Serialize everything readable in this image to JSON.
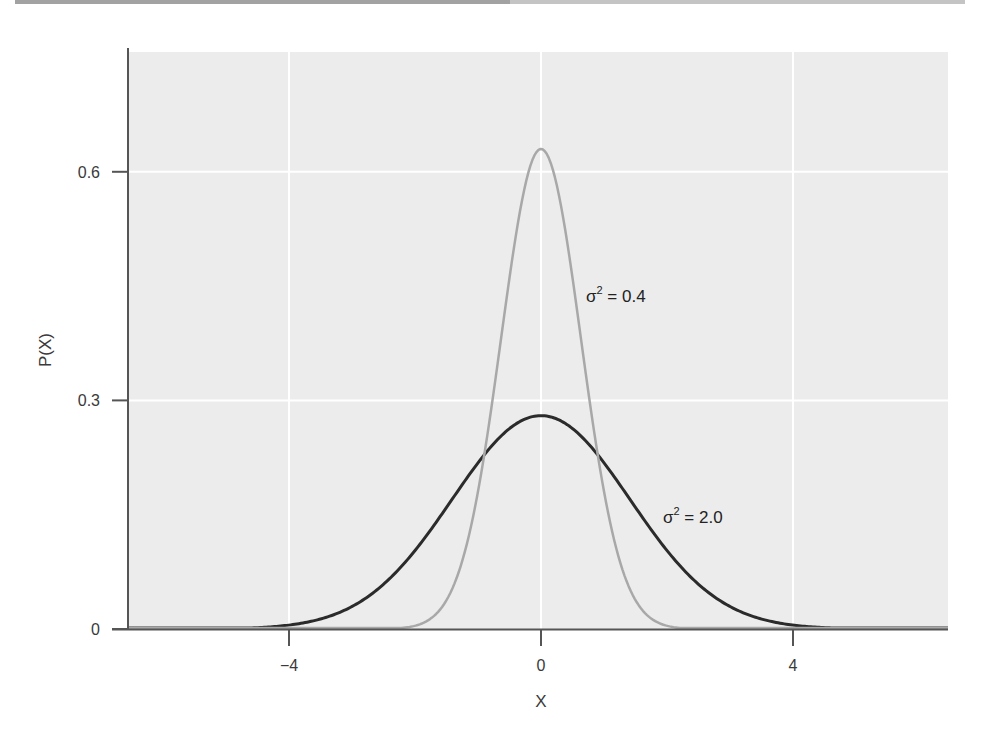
{
  "chart_data": {
    "type": "line",
    "title": "",
    "xlabel": "X",
    "ylabel": "P(X)",
    "xlim": [
      -6.3,
      6.4
    ],
    "ylim": [
      0,
      0.75
    ],
    "x_ticks": [
      -4,
      0,
      4
    ],
    "x_tick_labels": [
      "−4",
      "0",
      "4"
    ],
    "y_ticks": [
      0,
      0.3,
      0.6
    ],
    "y_tick_labels": [
      "0",
      "0.3",
      "0.6"
    ],
    "grid": true,
    "legend": "none (inline annotations)",
    "series": [
      {
        "name": "σ² = 0.4",
        "distribution": "normal",
        "mean": 0,
        "variance": 0.4,
        "peak": 0.63,
        "color": "#a8a8a8",
        "x": [
          -3,
          -2,
          -1.5,
          -1,
          -0.5,
          0,
          0.5,
          1,
          1.5,
          2,
          3
        ],
        "values": [
          0.0,
          0.004,
          0.037,
          0.181,
          0.461,
          0.631,
          0.461,
          0.181,
          0.037,
          0.004,
          0.0
        ]
      },
      {
        "name": "σ² = 2.0",
        "distribution": "normal",
        "mean": 0,
        "variance": 2.0,
        "peak": 0.28,
        "color": "#2b2b2b",
        "x": [
          -6,
          -5,
          -4,
          -3,
          -2,
          -1,
          0,
          1,
          2,
          3,
          4,
          5,
          6
        ],
        "values": [
          0.0003,
          0.0055,
          0.0511,
          0.0297,
          0.1038,
          0.2197,
          0.2821,
          0.2197,
          0.1038,
          0.0297,
          0.0051,
          0.0005,
          0.0
        ]
      }
    ],
    "annotations": [
      {
        "text": "σ² = 0.4",
        "x": 0.75,
        "y": 0.44
      },
      {
        "text": "σ² = 2.0",
        "x": 2.0,
        "y": 0.15
      }
    ]
  },
  "labels": {
    "xlabel": "X",
    "ylabel": "P(X)",
    "annot1_sym": "σ",
    "annot1_sup": "2",
    "annot1_val": " = 0.4",
    "annot2_sym": "σ",
    "annot2_sup": "2",
    "annot2_val": " = 2.0"
  },
  "colors": {
    "panel_bg": "#ececec",
    "grid": "#ffffff",
    "axis": "#555555",
    "narrow_curve": "#a8a8a8",
    "wide_curve": "#2b2b2b"
  }
}
